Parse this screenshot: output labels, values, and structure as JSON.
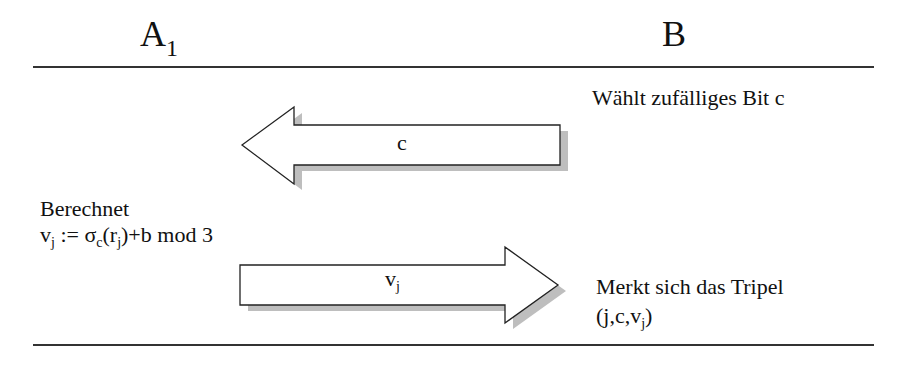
{
  "parties": {
    "left": {
      "name": "A",
      "subscript": "1"
    },
    "right": {
      "name": "B"
    }
  },
  "steps": {
    "b_choose": "Wählt zufälliges Bit  c",
    "msg_c_label": "c",
    "a_compute_title": "Berechnet",
    "a_compute_formula": {
      "v": "v",
      "j1": "j",
      "assign": " := σ",
      "c": "c",
      "open": "(r",
      "j2": "j",
      "rest": ")+b mod 3"
    },
    "msg_v_label": {
      "v": "v",
      "j": "j"
    },
    "b_store_title": "Merkt sich das Tripel",
    "b_store_tuple": {
      "open": "(j,c,v",
      "j": "j",
      "close": ")"
    }
  },
  "colors": {
    "line": "#333333",
    "arrow_fill": "#ffffff",
    "arrow_stroke": "#222222",
    "shadow": "#a0a0a0"
  }
}
